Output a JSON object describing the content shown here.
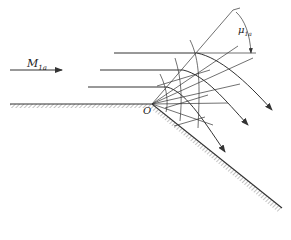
{
  "figure": {
    "labels": {
      "freestream_mach": "M",
      "freestream_mach_sub": "1a",
      "mach_angle": "μ",
      "mach_angle_sub": "1a",
      "corner": "O"
    },
    "colors": {
      "line": "#333333",
      "wall_hatch": "#999999"
    }
  }
}
